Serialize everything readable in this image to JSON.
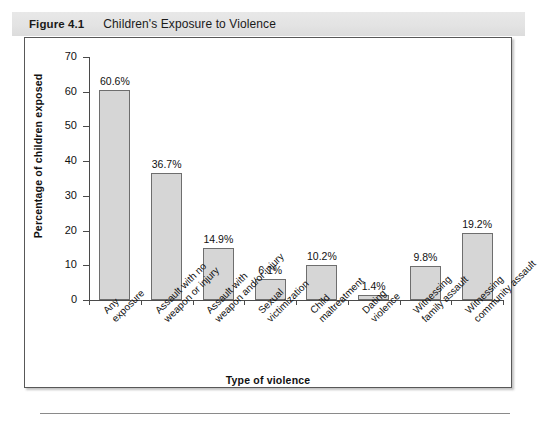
{
  "figure": {
    "number": "Figure 4.1",
    "title": "Children's Exposure to Violence"
  },
  "chart_data": {
    "type": "bar",
    "title": "Children's Exposure to Violence",
    "xlabel": "Type of violence",
    "ylabel": "Percentage of children exposed",
    "ylim": [
      0,
      70
    ],
    "ytick_values": [
      0,
      10,
      20,
      30,
      40,
      50,
      60,
      70
    ],
    "ytick_labels": [
      "0",
      "10",
      "20",
      "30",
      "40",
      "50",
      "60",
      "70"
    ],
    "grid": false,
    "legend": "none",
    "bar_color": "#d6d6d6",
    "bar_edge_color": "#6e6e6e",
    "categories": [
      "Any\nexposure",
      "Assault with no\nweapon or injury",
      "Assault with\nweapon and/or injury",
      "Sexual\nvictimization",
      "Child\nmaltreatment",
      "Dating\nviolence",
      "Witnessing\nfamily assault",
      "Witnessing\ncommunity assault"
    ],
    "values": [
      60.6,
      36.7,
      14.9,
      6.1,
      10.2,
      1.4,
      9.8,
      19.2
    ],
    "value_labels": [
      "60.6%",
      "36.7%",
      "14.9%",
      "6.1%",
      "10.2%",
      "1.4%",
      "9.8%",
      "19.2%"
    ]
  }
}
